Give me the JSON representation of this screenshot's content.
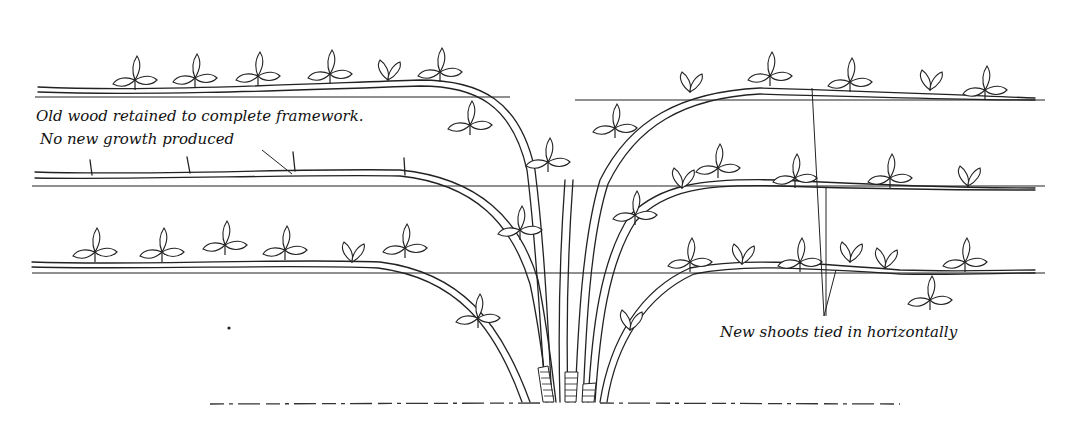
{
  "figure": {
    "type": "line-drawing",
    "wires": [
      {
        "name": "top",
        "y": 100
      },
      {
        "name": "middle",
        "y": 186
      },
      {
        "name": "bottom",
        "y": 273
      }
    ]
  },
  "labels": {
    "old_wood_line1": "Old wood retained to complete framework.",
    "old_wood_line2": "No new growth produced",
    "new_shoots": "New shoots tied in horizontally"
  }
}
